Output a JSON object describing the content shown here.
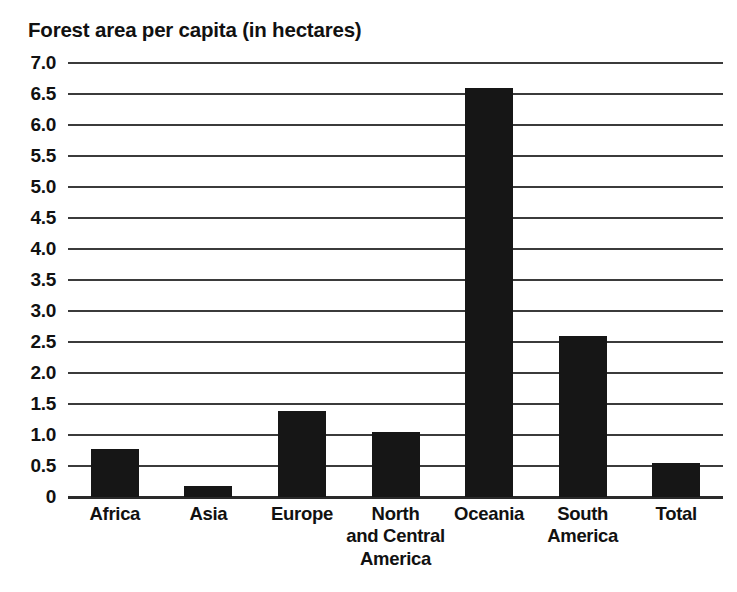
{
  "chart_data": {
    "type": "bar",
    "title": "Forest area per capita (in hectares)",
    "xlabel": "",
    "ylabel": "",
    "categories": [
      "Africa",
      "Asia",
      "Europe",
      "North and Central America",
      "Oceania",
      "South America",
      "Total"
    ],
    "category_label_lines": [
      [
        "Africa"
      ],
      [
        "Asia"
      ],
      [
        "Europe"
      ],
      [
        "North",
        "and Central",
        "America"
      ],
      [
        "Oceania"
      ],
      [
        "South",
        "America"
      ],
      [
        "Total"
      ]
    ],
    "values": [
      0.78,
      0.18,
      1.38,
      1.05,
      6.6,
      2.6,
      0.55
    ],
    "ylim": [
      0,
      7.0
    ],
    "ytick_values": [
      7.0,
      6.5,
      6.0,
      5.5,
      5.0,
      4.5,
      4.0,
      3.5,
      3.0,
      2.5,
      2.0,
      1.5,
      1.0,
      0.5,
      0
    ],
    "ytick_labels": [
      "7.0",
      "6.5",
      "6.0",
      "5.5",
      "5.0",
      "4.5",
      "4.0",
      "3.5",
      "3.0",
      "2.5",
      "2.0",
      "1.5",
      "1.0",
      "0.5",
      "0"
    ],
    "grid": true,
    "grid_axis": "y",
    "legend": false,
    "legend_position": "none",
    "bar_color": "#161616",
    "grid_color": "#3b3b3b",
    "axis_color": "#2a2a2a",
    "text_color": "#111111",
    "background_color": "#ffffff"
  }
}
